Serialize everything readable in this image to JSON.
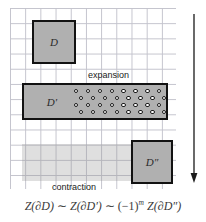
{
  "figure": {
    "grid": {
      "cell_size_px": 15,
      "color": "#b9b9c4",
      "visible": true
    },
    "domains": [
      {
        "id": "D",
        "label": "D",
        "role": "initial-domain",
        "shape": "square",
        "fill_color": "#b0b0b0",
        "border_color": "#121212",
        "position": "top-left",
        "grid_cells": [
          3,
          3
        ]
      },
      {
        "id": "D-prime",
        "label": "D′",
        "role": "expanded-domain",
        "shape": "rectangle",
        "fill_color": "#b0b0b0",
        "border_color": "#121212",
        "position": "middle-wide",
        "grid_cells": [
          10,
          2
        ],
        "contains_particles": true,
        "particle_rows": 4,
        "particle_columns": 8,
        "particle_count": 32,
        "particle_fill": "#ffffff",
        "particle_stroke": "#1a1a1a"
      },
      {
        "id": "D-double-prime",
        "label": "D″",
        "role": "contracted-domain",
        "shape": "square",
        "fill_color": "#b0b0b0",
        "border_color": "#121212",
        "position": "bottom-right",
        "grid_cells": [
          3,
          3
        ]
      }
    ],
    "ghost_region": {
      "role": "faded-previous-extent",
      "fill_color": "rgba(150,150,150,0.30)"
    },
    "process_labels": {
      "expansion": "expansion",
      "contraction": "contraction"
    },
    "time_arrow": {
      "name": "time-arrow",
      "direction": "down",
      "color": "#1a1a1a"
    },
    "equation": {
      "full_text": "Z(∂D) ~ Z(∂D′) ~ (−1)ᵐ Z(∂D″)",
      "part1": "Z(∂D)",
      "sim1": "∼",
      "part2": "Z(∂D′)",
      "sim2": "∼",
      "sign_base": "(−1)",
      "sign_exponent": "m",
      "part3": "Z(∂D″)"
    }
  }
}
